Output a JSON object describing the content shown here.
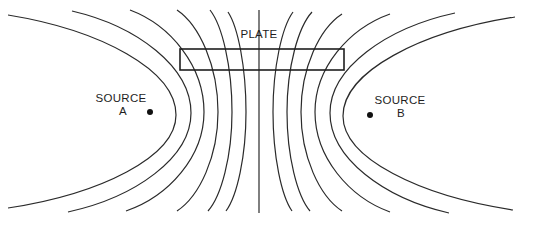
{
  "diagram": {
    "plate_label": "PLATE",
    "source_a": {
      "line1": "SOURCE",
      "line2": "A"
    },
    "source_b": {
      "line1": "SOURCE",
      "line2": "B"
    }
  },
  "colors": {
    "lines": "#2a2a2a",
    "background": "#ffffff"
  },
  "field_lines": [
    {
      "top": [
        8,
        15
      ],
      "vertex": [
        176,
        115
      ],
      "bottom": [
        8,
        208
      ]
    },
    {
      "top": [
        72,
        11
      ],
      "vertex": [
        191,
        113
      ],
      "bottom": [
        68,
        212
      ]
    },
    {
      "top": [
        130,
        10
      ],
      "vertex": [
        204,
        112
      ],
      "bottom": [
        126,
        211
      ]
    },
    {
      "top": [
        177,
        10
      ],
      "vertex": [
        218,
        112
      ],
      "bottom": [
        177,
        211
      ]
    },
    {
      "top": [
        210,
        10
      ],
      "vertex": [
        232,
        112
      ],
      "bottom": [
        208,
        211
      ]
    },
    {
      "top": [
        228,
        12
      ],
      "vertex": [
        246,
        112
      ],
      "bottom": [
        226,
        211
      ]
    },
    {
      "top": [
        259,
        10
      ],
      "vertex": [
        259,
        112
      ],
      "bottom": [
        259,
        213
      ]
    },
    {
      "top": [
        293,
        12
      ],
      "vertex": [
        273,
        112
      ],
      "bottom": [
        292,
        211
      ]
    },
    {
      "top": [
        312,
        12
      ],
      "vertex": [
        287,
        112
      ],
      "bottom": [
        310,
        211
      ]
    },
    {
      "top": [
        342,
        14
      ],
      "vertex": [
        301,
        112
      ],
      "bottom": [
        342,
        211
      ]
    },
    {
      "top": [
        390,
        14
      ],
      "vertex": [
        315,
        112
      ],
      "bottom": [
        390,
        212
      ]
    },
    {
      "top": [
        455,
        13
      ],
      "vertex": [
        330,
        113
      ],
      "bottom": [
        449,
        213
      ]
    },
    {
      "top": [
        515,
        17
      ],
      "vertex": [
        343,
        116
      ],
      "bottom": [
        513,
        210
      ]
    }
  ],
  "plate": {
    "x": 180,
    "y": 49,
    "width": 164,
    "height": 21
  },
  "source_a_dot": {
    "cx": 150,
    "cy": 112
  },
  "source_b_dot": {
    "cx": 370,
    "cy": 115
  }
}
